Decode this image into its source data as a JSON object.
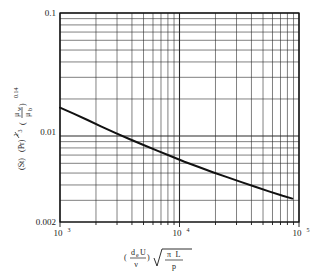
{
  "chart_data": {
    "type": "line",
    "title": "",
    "subtitle": "",
    "xlabel": "(d_e U / v) sqrt(pi L / p)",
    "ylabel": "(St)(Pr)^(2/3) (mu_w / mu_b)^0.14",
    "xscale": "log",
    "yscale": "log",
    "xlim": [
      1000,
      100000
    ],
    "ylim": [
      0.002,
      0.1
    ],
    "grid": "log-minor-both-axes",
    "legend": "none",
    "xticks": [
      {
        "value": 1000,
        "mantissa": "10",
        "exponent": "3"
      },
      {
        "value": 10000,
        "mantissa": "10",
        "exponent": "4"
      },
      {
        "value": 100000,
        "mantissa": "10",
        "exponent": "5"
      }
    ],
    "yticks": [
      {
        "value": 0.1,
        "label": "0.1"
      },
      {
        "value": 0.01,
        "label": "0.01"
      },
      {
        "value": 0.002,
        "label": "0.002"
      }
    ],
    "series": [
      {
        "name": "heat transfer correlation curve",
        "color": "#111111",
        "linewidth": 2.0,
        "x": [
          1000,
          1300,
          1700,
          2200,
          2900,
          3800,
          5000,
          6500,
          8500,
          11000,
          14500,
          19000,
          25000,
          33000,
          43000,
          56000,
          73000,
          88000
        ],
        "y": [
          0.017,
          0.0152,
          0.0135,
          0.012,
          0.0106,
          0.00945,
          0.00845,
          0.0076,
          0.00685,
          0.00618,
          0.0056,
          0.00508,
          0.00463,
          0.00422,
          0.00387,
          0.00355,
          0.00327,
          0.0031
        ]
      }
    ]
  },
  "axis_labels": {
    "y": {
      "st": "(St)",
      "pr": "(Pr)",
      "pr_exp_num": "2",
      "pr_exp_den": "3",
      "mu_num": "μ",
      "mu_num_sub": "w",
      "mu_den": "μ",
      "mu_den_sub": "b",
      "mu_exp": "0.14"
    },
    "x": {
      "de": "d",
      "de_sub": "e",
      "u": "U",
      "nu": "ν",
      "pi": "π",
      "l": "L",
      "p": "p"
    }
  }
}
